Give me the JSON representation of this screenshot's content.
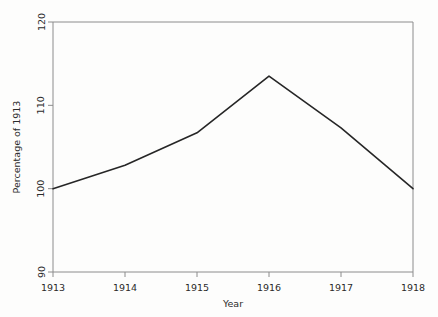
{
  "chart_data": {
    "type": "line",
    "title": "",
    "xlabel": "Year",
    "ylabel": "Percentage of 1913",
    "x": [
      1913,
      1914,
      1915,
      1916,
      1917,
      1918
    ],
    "categories": [
      "1913",
      "1914",
      "1915",
      "1916",
      "1917",
      "1918"
    ],
    "values": [
      100,
      102.8,
      106.7,
      113.5,
      107.3,
      100
    ],
    "series": [
      {
        "name": "Percentage of 1913",
        "values": [
          100,
          102.8,
          106.7,
          113.5,
          107.3,
          100
        ]
      }
    ],
    "xlim": [
      1913,
      1918
    ],
    "ylim": [
      90,
      120
    ],
    "xticks": [
      "1913",
      "1914",
      "1915",
      "1916",
      "1917",
      "1918"
    ],
    "yticks": [
      "90",
      "100",
      "110",
      "120"
    ],
    "ytick_values": [
      90,
      100,
      110,
      120
    ],
    "grid": false,
    "legend": false,
    "legend_position": "none",
    "line_color": "#262626",
    "frame_color": "#8c8c8c",
    "background_color": "#fdfdfc"
  },
  "axes": {
    "x_title": "Year",
    "y_title": "Percentage of 1913"
  },
  "x_tick_labels": [
    {
      "text": "1913"
    },
    {
      "text": "1914"
    },
    {
      "text": "1915"
    },
    {
      "text": "1916"
    },
    {
      "text": "1917"
    },
    {
      "text": "1918"
    }
  ],
  "y_tick_labels": [
    {
      "text": "120"
    },
    {
      "text": "110"
    },
    {
      "text": "100"
    },
    {
      "text": "90"
    }
  ]
}
